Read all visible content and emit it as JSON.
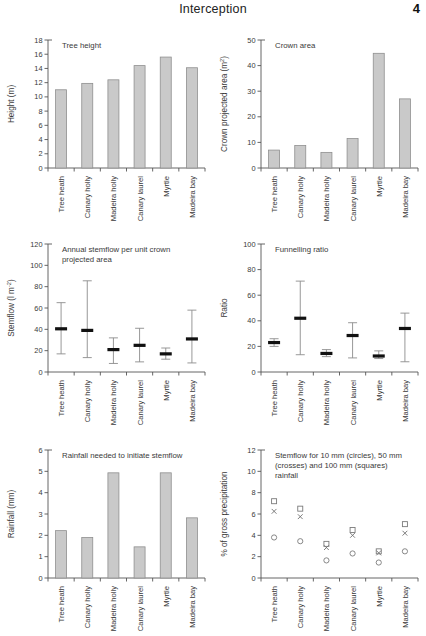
{
  "header": {
    "title": "Interception",
    "page_number": "4"
  },
  "categories": [
    "Tree heath",
    "Canary holly",
    "Madeira holly",
    "Canary laurel",
    "Myrtle",
    "Madeira bay"
  ],
  "chart_data": [
    {
      "id": "tree-height",
      "type": "bar",
      "title": "Tree height",
      "xlabel": "",
      "ylabel": "Height (m)",
      "ylim": [
        0,
        18
      ],
      "yticks": [
        0,
        2,
        4,
        6,
        8,
        10,
        12,
        14,
        16,
        18
      ],
      "ytick_labels": [
        "0",
        "2",
        "4",
        "6",
        "8",
        "10",
        "12",
        "14",
        "16",
        "18"
      ],
      "categories": [
        "Tree heath",
        "Canary holly",
        "Madeira holly",
        "Canary laurel",
        "Myrtle",
        "Madeira bay"
      ],
      "values": [
        11.0,
        11.9,
        12.4,
        14.4,
        15.6,
        14.1
      ],
      "grid": false,
      "legend": "none"
    },
    {
      "id": "crown-area",
      "type": "bar",
      "title": "Crown area",
      "xlabel": "",
      "ylabel": "Crown projected area (m2)",
      "ylabel_main": "Crown projected area (m",
      "ylabel_sup": "2",
      "ylabel_tail": ")",
      "ylim": [
        0,
        50
      ],
      "yticks": [
        0,
        10,
        20,
        30,
        40,
        50
      ],
      "ytick_labels": [
        "0",
        "10",
        "20",
        "30",
        "40",
        "50"
      ],
      "categories": [
        "Tree heath",
        "Canary holly",
        "Madeira holly",
        "Canary laurel",
        "Myrtle",
        "Madeira bay"
      ],
      "values": [
        7.0,
        8.8,
        6.1,
        11.5,
        44.8,
        27.0
      ],
      "grid": false,
      "legend": "none"
    },
    {
      "id": "annual-stemflow",
      "type": "errorbar",
      "title_line1": "Annual stemflow per unit crown",
      "title_line2": "projected area",
      "title": "Annual stemflow per unit crown projected area",
      "xlabel": "",
      "ylabel": "Stemflow (l m-2)",
      "ylabel_main": "Stemflow (l m",
      "ylabel_sup": "-2",
      "ylabel_tail": ")",
      "ylim": [
        0,
        120
      ],
      "yticks": [
        0,
        20,
        40,
        60,
        80,
        100,
        120
      ],
      "ytick_labels": [
        "0",
        "20",
        "40",
        "60",
        "80",
        "100",
        "120"
      ],
      "categories": [
        "Tree heath",
        "Canary holly",
        "Madeira holly",
        "Canary laurel",
        "Myrtle",
        "Madeira bay"
      ],
      "means": [
        40.5,
        39.0,
        21.0,
        25.0,
        17.0,
        31.0
      ],
      "low": [
        17.0,
        13.5,
        8.0,
        9.5,
        12.0,
        8.5
      ],
      "high": [
        65.0,
        85.5,
        32.0,
        41.0,
        22.5,
        58.0
      ],
      "grid": false,
      "legend": "none"
    },
    {
      "id": "funnelling-ratio",
      "type": "errorbar",
      "title": "Funnelling ratio",
      "xlabel": "",
      "ylabel": "Ratio",
      "ylim": [
        0,
        100
      ],
      "yticks": [
        0,
        20,
        40,
        60,
        80,
        100
      ],
      "ytick_labels": [
        "0",
        "20",
        "40",
        "60",
        "80",
        "100"
      ],
      "categories": [
        "Tree heath",
        "Canary holly",
        "Madeira holly",
        "Canary laurel",
        "Myrtle",
        "Madeira bay"
      ],
      "means": [
        23.0,
        42.0,
        14.5,
        28.5,
        12.5,
        34.0
      ],
      "low": [
        20.0,
        13.5,
        12.0,
        11.0,
        10.5,
        8.0
      ],
      "high": [
        26.0,
        71.0,
        17.5,
        38.5,
        16.5,
        46.0
      ],
      "grid": false,
      "legend": "none"
    },
    {
      "id": "rainfall-initiate-stemflow",
      "type": "bar",
      "title": "Rainfall needed to initiate stemflow",
      "xlabel": "",
      "ylabel": "Rainfall (mm)",
      "ylim": [
        0,
        6
      ],
      "yticks": [
        0,
        1,
        2,
        3,
        4,
        5,
        6
      ],
      "ytick_labels": [
        "0",
        "1",
        "2",
        "3",
        "4",
        "5",
        "6"
      ],
      "categories": [
        "Tree heath",
        "Canary holly",
        "Madeira holly",
        "Canary laurel",
        "Myrtle",
        "Madeira bay"
      ],
      "values": [
        2.22,
        1.9,
        4.93,
        1.46,
        4.93,
        2.82
      ],
      "grid": false,
      "legend": "none"
    },
    {
      "id": "stemflow-percent-gross-precip",
      "type": "scatter",
      "title_line1": "Stemflow for 10 mm (circles), 50 mm",
      "title_line2": "(crosses) and 100 mm (squares)",
      "title_line3": "rainfall",
      "title": "Stemflow for 10 mm (circles), 50 mm (crosses) and 100 mm (squares) rainfall",
      "xlabel": "",
      "ylabel": "% of gross precipitation",
      "ylim": [
        0,
        12
      ],
      "yticks": [
        0,
        2,
        4,
        6,
        8,
        10,
        12
      ],
      "ytick_labels": [
        "0",
        "2",
        "4",
        "6",
        "8",
        "10",
        "12"
      ],
      "categories": [
        "Tree heath",
        "Canary holly",
        "Madeira holly",
        "Canary laurel",
        "Myrtle",
        "Madeira bay"
      ],
      "series": [
        {
          "name": "10 mm (circles)",
          "marker": "circle",
          "values": [
            3.8,
            3.45,
            1.65,
            2.3,
            1.45,
            2.5
          ]
        },
        {
          "name": "50 mm (crosses)",
          "marker": "cross",
          "values": [
            6.25,
            5.75,
            2.85,
            4.0,
            2.35,
            4.2
          ]
        },
        {
          "name": "100 mm (squares)",
          "marker": "square",
          "values": [
            7.2,
            6.5,
            3.2,
            4.5,
            2.5,
            5.05
          ]
        }
      ],
      "grid": false,
      "legend": "in-caption"
    }
  ]
}
